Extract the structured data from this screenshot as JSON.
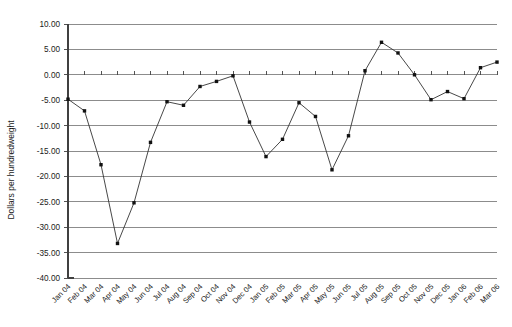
{
  "chart_data": {
    "type": "line",
    "title": "",
    "xlabel": "",
    "ylabel": "Dollars per hundredweight",
    "ylim": [
      -40.0,
      10.0
    ],
    "ytick_step": 5.0,
    "ytick_labels": [
      "10.00",
      "5.00",
      "0.00",
      "-5.00",
      "-10.00",
      "-15.00",
      "-20.00",
      "-25.00",
      "-30.00",
      "-35.00",
      "-40.00"
    ],
    "ytick_values": [
      10.0,
      5.0,
      0.0,
      -5.0,
      -10.0,
      -15.0,
      -20.0,
      -25.0,
      -30.0,
      -35.0,
      -40.0
    ],
    "grid": true,
    "legend": "none",
    "categories": [
      "Jan 04",
      "Feb 04",
      "Mar 04",
      "Apr 04",
      "May 04",
      "Jun 04",
      "Jul 04",
      "Aug 04",
      "Sep 04",
      "Oct 04",
      "Nov 04",
      "Dec 04",
      "Jan 05",
      "Feb 05",
      "Mar 05",
      "Apr 05",
      "May 05",
      "Jun 05",
      "Jul 05",
      "Aug 05",
      "Sep 05",
      "Oct 05",
      "Nov 05",
      "Dec 05",
      "Jan 06",
      "Feb 06",
      "Mar 06"
    ],
    "values": [
      -4.8,
      -7.1,
      -17.7,
      -33.2,
      -25.2,
      -13.3,
      -5.3,
      -6.0,
      -2.3,
      -1.3,
      -0.2,
      -9.3,
      -16.1,
      -12.7,
      -5.5,
      -8.2,
      -18.7,
      -12.0,
      0.8,
      6.4,
      4.3,
      0.0,
      -4.9,
      -3.3,
      -4.7,
      1.4,
      2.5
    ],
    "series_name": "Dollars per hundredweight",
    "marker": "square",
    "line_color": "#333333",
    "marker_color": "#111111",
    "grid_color": "#808080",
    "background_color": "#ffffff"
  }
}
